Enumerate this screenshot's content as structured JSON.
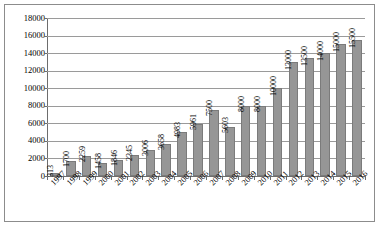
{
  "chart_data": {
    "type": "bar",
    "title": "",
    "subtitle": "",
    "xlabel": "",
    "ylabel": "",
    "ylim": [
      0,
      18000
    ],
    "ytick_step": 2000,
    "yticks": [
      "0",
      "2000",
      "4000",
      "6000",
      "8000",
      "10000",
      "12000",
      "14000",
      "16000",
      "18000"
    ],
    "grid": true,
    "legend": "none",
    "bar_color": "#969696",
    "bar_border_color": "#7b7b7b",
    "gridline_color": "#9a9a9a",
    "axis_color": "#6d6d6d",
    "frame_color": "#8c8c8c",
    "categories": [
      "1997",
      "1998",
      "1999",
      "2000",
      "2001",
      "2002",
      "2003",
      "2004",
      "2005",
      "2006",
      "2007",
      "2008",
      "2009",
      "2010",
      "2011",
      "2012",
      "2013",
      "2014",
      "2015",
      "2016"
    ],
    "values": [
      313,
      1700,
      2259,
      1458,
      1846,
      2345,
      3006,
      3658,
      4983,
      5961,
      7500,
      5603,
      8000,
      8000,
      10000,
      13000,
      13500,
      14000,
      15000,
      15500
    ],
    "data_labels": [
      "313",
      "1700",
      "2259",
      "1458",
      "1846",
      "2345",
      "3006",
      "3658",
      "4983",
      "5961",
      "7500",
      "5603",
      "8000",
      "8000",
      "10000",
      "13000",
      "13500",
      "14000",
      "15000",
      "15500"
    ]
  }
}
